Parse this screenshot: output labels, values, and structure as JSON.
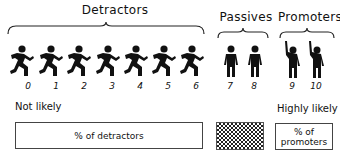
{
  "groups": [
    {
      "name": "Detractors",
      "scores": [
        "0",
        "1",
        "2",
        "3",
        "4",
        "5",
        "6"
      ],
      "figure": "running-person"
    },
    {
      "name": "Passives",
      "scores": [
        "7",
        "8"
      ],
      "figure": "standing-person"
    },
    {
      "name": "Promoters",
      "scores": [
        "9",
        "10"
      ],
      "figure": "hand-raised-person"
    }
  ],
  "scale": {
    "low_label": "Not likely",
    "high_label": "Highly likely"
  },
  "boxes": {
    "detractors": "% of detractors",
    "passives": "",
    "promoters_line1": "% of",
    "promoters_line2": "promoters"
  }
}
